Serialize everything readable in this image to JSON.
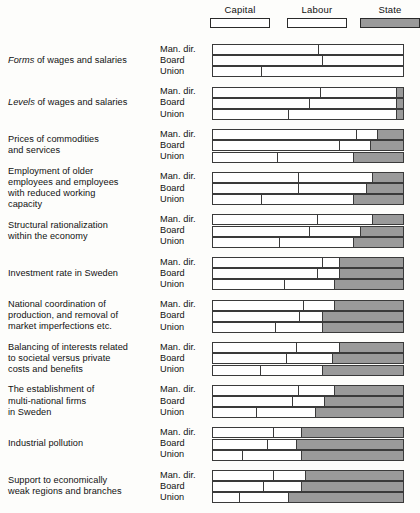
{
  "chart_data": {
    "type": "bar",
    "subtype": "100% stacked horizontal, grouped",
    "title": "",
    "xlabel": "",
    "ylabel": "",
    "xlim": [
      0,
      100
    ],
    "grid": false,
    "legend_position": "top-right",
    "legend": [
      {
        "name": "Capital",
        "color": "#ffffff",
        "border": "#2a2a2a"
      },
      {
        "name": "Labour",
        "color": "#ffffff",
        "border": "#2a2a2a"
      },
      {
        "name": "State",
        "color": "#9a9a9a",
        "border": "#2a2a2a"
      }
    ],
    "series": [
      "Capital",
      "Labour",
      "State"
    ],
    "actors": [
      "Man. dir.",
      "Board",
      "Union"
    ],
    "categories": [
      "Forms of wages and salaries",
      "Levels of wages and salaries",
      "Prices of commodities and services",
      "Employment of older employees and employees with reduced working capacity",
      "Structural rationalization within the economy",
      "Investment rate in Sweden",
      "National coordination of production, and removal of market imperfections etc.",
      "Balancing of interests related to societal versus private costs and benefits",
      "The establishment of multi-national firms in Sweden",
      "Industrial pollution",
      "Support to economically weak regions and branches"
    ],
    "groups": [
      {
        "category_lines": [
          "Forms of wages and salaries"
        ],
        "italic_word": "Forms",
        "rows": [
          {
            "actor": "Man. dir.",
            "values": [
              56,
              44,
              0
            ]
          },
          {
            "actor": "Board",
            "values": [
              58,
              42,
              0
            ]
          },
          {
            "actor": "Union",
            "values": [
              26,
              74,
              0
            ]
          }
        ]
      },
      {
        "category_lines": [
          "Levels of wages and salaries"
        ],
        "italic_word": "Levels",
        "rows": [
          {
            "actor": "Man. dir.",
            "values": [
              57,
              40,
              3
            ]
          },
          {
            "actor": "Board",
            "values": [
              51,
              46,
              3
            ]
          },
          {
            "actor": "Union",
            "values": [
              40,
              57,
              3
            ]
          }
        ]
      },
      {
        "category_lines": [
          "Prices of commodities",
          "and services"
        ],
        "rows": [
          {
            "actor": "Man. dir.",
            "values": [
              76,
              11,
              13
            ]
          },
          {
            "actor": "Board",
            "values": [
              67,
              16,
              17
            ]
          },
          {
            "actor": "Union",
            "values": [
              34,
              40,
              26
            ]
          }
        ]
      },
      {
        "category_lines": [
          "Employment of older",
          "employees and employees",
          "with reduced working",
          "capacity"
        ],
        "rows": [
          {
            "actor": "Man. dir.",
            "values": [
              45,
              39,
              16
            ]
          },
          {
            "actor": "Board",
            "values": [
              45,
              36,
              19
            ]
          },
          {
            "actor": "Union",
            "values": [
              26,
              48,
              26
            ]
          }
        ]
      },
      {
        "category_lines": [
          "Structural rationalization",
          "within the economy"
        ],
        "rows": [
          {
            "actor": "Man. dir.",
            "values": [
              55,
              29,
              16
            ]
          },
          {
            "actor": "Board",
            "values": [
              51,
              27,
              22
            ]
          },
          {
            "actor": "Union",
            "values": [
              35,
              39,
              26
            ]
          }
        ]
      },
      {
        "category_lines": [
          "Investment rate in Sweden"
        ],
        "rows": [
          {
            "actor": "Man. dir.",
            "values": [
              58,
              9,
              33
            ]
          },
          {
            "actor": "Board",
            "values": [
              55,
              12,
              33
            ]
          },
          {
            "actor": "Union",
            "values": [
              38,
              26,
              36
            ]
          }
        ]
      },
      {
        "category_lines": [
          "National coordination of",
          "production, and removal of",
          "market imperfections etc."
        ],
        "rows": [
          {
            "actor": "Man. dir.",
            "values": [
              48,
              16,
              36
            ]
          },
          {
            "actor": "Board",
            "values": [
              46,
              12,
              42
            ]
          },
          {
            "actor": "Union",
            "values": [
              33,
              25,
              42
            ]
          }
        ]
      },
      {
        "category_lines": [
          "Balancing of interests related",
          "to societal versus private",
          "costs and benefits"
        ],
        "rows": [
          {
            "actor": "Man. dir.",
            "values": [
              44,
              23,
              33
            ]
          },
          {
            "actor": "Board",
            "values": [
              39,
              24,
              37
            ]
          },
          {
            "actor": "Union",
            "values": [
              25,
              33,
              42
            ]
          }
        ]
      },
      {
        "category_lines": [
          "The establishment of",
          "multi-national firms",
          "in Sweden"
        ],
        "rows": [
          {
            "actor": "Man. dir.",
            "values": [
              45,
              19,
              36
            ]
          },
          {
            "actor": "Board",
            "values": [
              42,
              17,
              41
            ]
          },
          {
            "actor": "Union",
            "values": [
              23,
              31,
              46
            ]
          }
        ]
      },
      {
        "category_lines": [
          "Industrial pollution"
        ],
        "rows": [
          {
            "actor": "Man. dir.",
            "values": [
              32,
              15,
              53
            ]
          },
          {
            "actor": "Board",
            "values": [
              29,
              15,
              56
            ]
          },
          {
            "actor": "Union",
            "values": [
              16,
              31,
              53
            ]
          }
        ]
      },
      {
        "category_lines": [
          "Support to economically",
          "weak regions and branches"
        ],
        "rows": [
          {
            "actor": "Man. dir.",
            "values": [
              32,
              17,
              51
            ]
          },
          {
            "actor": "Board",
            "values": [
              27,
              20,
              53
            ]
          },
          {
            "actor": "Union",
            "values": [
              14,
              26,
              60
            ]
          }
        ]
      }
    ]
  }
}
